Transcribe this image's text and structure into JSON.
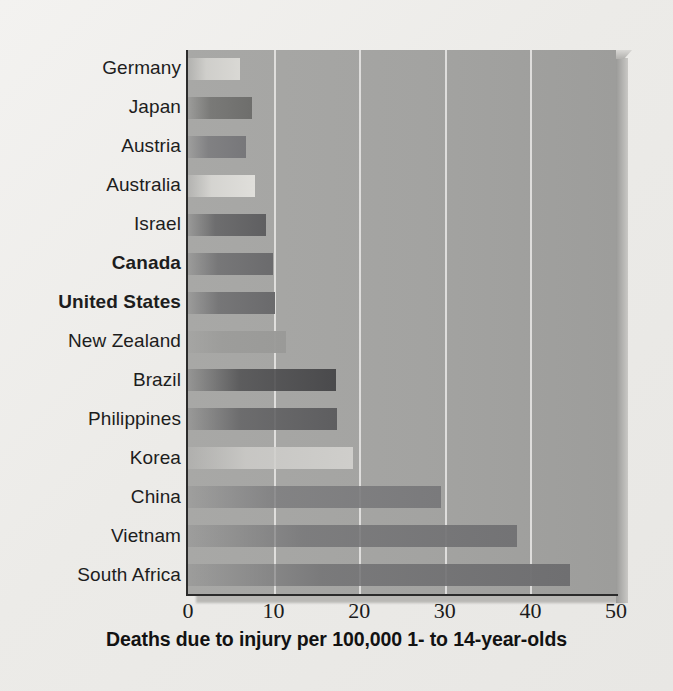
{
  "chart_data": {
    "type": "bar",
    "orientation": "horizontal",
    "title": "",
    "xlabel": "Deaths due to injury per 100,000 1- to 14-year-olds",
    "ylabel": "",
    "xlim": [
      0,
      50
    ],
    "xticks": [
      0,
      10,
      20,
      30,
      40,
      50
    ],
    "xtick_labels": [
      "0",
      "10",
      "20",
      "30",
      "40",
      "50"
    ],
    "grid": "vertical",
    "legend": "none",
    "categories": [
      "Germany",
      "Japan",
      "Austria",
      "Australia",
      "Israel",
      "Canada",
      "United States",
      "New Zealand",
      "Brazil",
      "Philippines",
      "Korea",
      "China",
      "Vietnam",
      "South Africa"
    ],
    "values": [
      6.1,
      7.5,
      6.8,
      7.8,
      9.1,
      9.9,
      10.2,
      11.5,
      17.3,
      17.4,
      19.3,
      29.6,
      38.4,
      44.6
    ],
    "highlighted": [
      "Canada",
      "United States"
    ],
    "bar_colors": [
      "#d9d8d4",
      "#6e6e6c",
      "#77777a",
      "#e0dfdb",
      "#5f5f61",
      "#6b6b6d",
      "#6a6a6c",
      "#9a9a98",
      "#4a4a4c",
      "#5e5e60",
      "#cfcecb",
      "#7a7a7c",
      "#737375",
      "#6f6f71"
    ]
  },
  "caption": {
    "text": "Deaths due to injury per 100,000 1- to 14-year-olds"
  },
  "axis": {
    "ticks": [
      "0",
      "10",
      "20",
      "30",
      "40",
      "50"
    ]
  }
}
